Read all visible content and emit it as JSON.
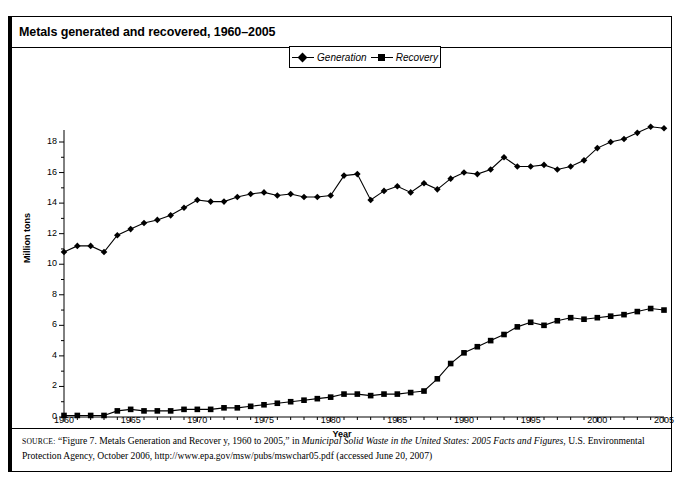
{
  "figure_label": "FIGURE 7.2",
  "title": "Metals generated and recovered, 1960–2005",
  "legend": {
    "generation": "Generation",
    "recovery": "Recovery"
  },
  "axes": {
    "xlabel": "Year",
    "ylabel": "Million tons",
    "ytick_labels": [
      "0",
      "2",
      "4",
      "6",
      "8",
      "10",
      "12",
      "14",
      "16",
      "18"
    ],
    "xtick_labels": [
      "1960",
      "1965",
      "1970",
      "1975",
      "1980",
      "1985",
      "1990",
      "1995",
      "2000",
      "2005"
    ]
  },
  "source": {
    "keyword": "Source:",
    "line1_a": "“Figure 7. Metals Generation and Recover y, 1960 to 2005,” in ",
    "line1_italic": "Municipal Solid Waste in the United States: 2005 Facts and Figures",
    "line1_b": ", U.S.",
    "line2": "Environmental Protection Agency, October 2006, http://www.epa.gov/msw/pubs/mswchar05.pdf (accessed June 20, 2007)"
  },
  "colors": {
    "series": "#000000",
    "frame": "#000000",
    "background": "#ffffff"
  },
  "chart_data": {
    "type": "line",
    "title": "Metals generated and recovered, 1960–2005",
    "xlabel": "Year",
    "ylabel": "Million tons",
    "xlim": [
      1960,
      2005
    ],
    "ylim": [
      0,
      18
    ],
    "ytick_step": 2,
    "xtick_step": 5,
    "grid": false,
    "legend_position": "top-center",
    "x": [
      1960,
      1961,
      1962,
      1963,
      1964,
      1965,
      1966,
      1967,
      1968,
      1969,
      1970,
      1971,
      1972,
      1973,
      1974,
      1975,
      1976,
      1977,
      1978,
      1979,
      1980,
      1981,
      1982,
      1983,
      1984,
      1985,
      1986,
      1987,
      1988,
      1989,
      1990,
      1991,
      1992,
      1993,
      1994,
      1995,
      1996,
      1997,
      1998,
      1999,
      2000,
      2001,
      2002,
      2003,
      2004,
      2005
    ],
    "series": [
      {
        "name": "Generation",
        "marker": "diamond",
        "values": [
          10.8,
          11.2,
          11.2,
          10.8,
          11.9,
          12.3,
          12.7,
          12.9,
          13.2,
          13.7,
          14.2,
          14.1,
          14.1,
          14.4,
          14.6,
          14.7,
          14.5,
          14.6,
          14.4,
          14.4,
          14.5,
          15.8,
          15.9,
          14.2,
          14.8,
          15.1,
          14.7,
          15.3,
          14.9,
          15.6,
          16.0,
          15.9,
          16.2,
          17.0,
          16.4,
          16.4,
          16.5,
          16.2,
          16.4,
          16.8,
          17.6,
          18.0,
          18.2,
          18.6,
          19.0,
          18.9
        ]
      },
      {
        "name": "Recovery",
        "marker": "square",
        "values": [
          0.1,
          0.1,
          0.1,
          0.1,
          0.4,
          0.5,
          0.4,
          0.4,
          0.4,
          0.5,
          0.5,
          0.5,
          0.6,
          0.6,
          0.7,
          0.8,
          0.9,
          1.0,
          1.1,
          1.2,
          1.3,
          1.5,
          1.5,
          1.4,
          1.5,
          1.5,
          1.6,
          1.7,
          2.5,
          3.5,
          4.2,
          4.6,
          5.0,
          5.4,
          5.9,
          6.2,
          6.0,
          6.3,
          6.5,
          6.4,
          6.5,
          6.6,
          6.7,
          6.9,
          7.1,
          7.0
        ]
      }
    ]
  }
}
